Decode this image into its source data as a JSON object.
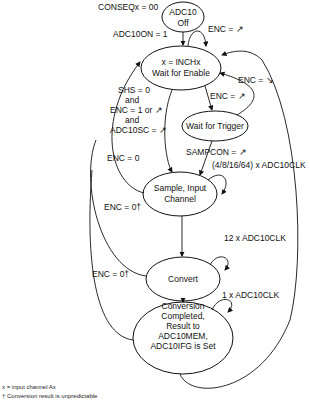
{
  "diagram": {
    "type": "state-machine",
    "states": {
      "off": {
        "line1": "ADC10",
        "line2": "Off"
      },
      "wait_enable": {
        "line1": "x = INCHx",
        "line2": "Wait for Enable"
      },
      "wait_trigger": {
        "line1": "Wait for Trigger"
      },
      "sample": {
        "line1": "Sample, Input",
        "line2": "Channel"
      },
      "convert": {
        "line1": "Convert"
      },
      "completed": {
        "line1": "Conversion",
        "line2": "Completed,",
        "line3": "Result to",
        "line4": "ADC10MEM,",
        "line5": "ADC10IFG is Set"
      }
    },
    "labels": {
      "conseq": "CONSEQx = 00",
      "adc10on": "ADC10ON = 1",
      "enc_rise_self": "ENC = ↗",
      "enc_fall": "ENC = ↘",
      "enc_rise_trigger": "ENC = ↗",
      "shs": "SHS = 0",
      "and1": "and",
      "enc1": "ENC = 1 or ↗",
      "and2": "and",
      "adc10sc": "ADC10SC = ↗",
      "sampcon": "SAMPCON = ↗",
      "sample_clk": "(4/8/16/64) x ADC10CLK",
      "enc0_a": "ENC = 0",
      "enc0_b": "ENC = 0†",
      "convert_clk": "12 x ADC10CLK",
      "enc0_c": "ENC = 0†",
      "complete_clk": "1 x ADC10CLK"
    },
    "footnotes": {
      "x": "x = input channel Ax",
      "dagger": "† Conversion result is unpredictable"
    }
  }
}
